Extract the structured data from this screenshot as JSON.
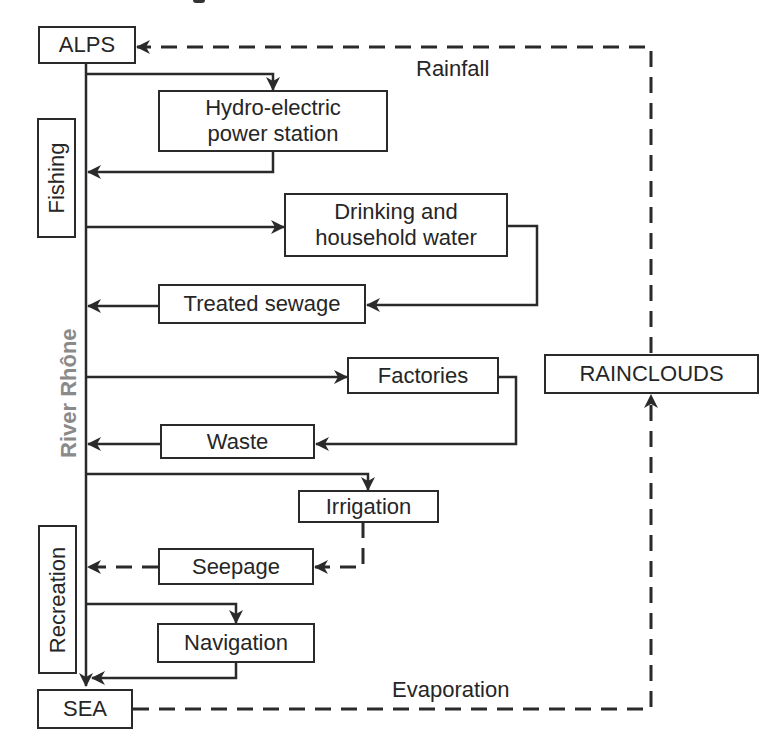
{
  "diagram": {
    "type": "flow",
    "river_label": "River Rhône",
    "nodes": {
      "alps": "ALPS",
      "hydro_line1": "Hydro-electric",
      "hydro_line2": "power station",
      "fishing": "Fishing",
      "drinking_line1": "Drinking and",
      "drinking_line2": "household water",
      "treated_sewage": "Treated sewage",
      "factories": "Factories",
      "waste": "Waste",
      "irrigation": "Irrigation",
      "seepage": "Seepage",
      "navigation": "Navigation",
      "recreation": "Recreation",
      "sea": "SEA",
      "rainclouds": "RAINCLOUDS"
    },
    "edge_labels": {
      "rainfall": "Rainfall",
      "evaporation": "Evaporation"
    },
    "edges": [
      {
        "from": "ALPS",
        "to": "River Rhône",
        "style": "solid"
      },
      {
        "from": "River Rhône",
        "to": "Hydro-electric power station",
        "style": "solid"
      },
      {
        "from": "Hydro-electric power station",
        "to": "River Rhône",
        "style": "solid"
      },
      {
        "from": "River Rhône",
        "to": "Drinking and household water",
        "style": "solid"
      },
      {
        "from": "Drinking and household water",
        "to": "Treated sewage",
        "style": "solid"
      },
      {
        "from": "Treated sewage",
        "to": "River Rhône",
        "style": "solid"
      },
      {
        "from": "River Rhône",
        "to": "Factories",
        "style": "solid"
      },
      {
        "from": "Factories",
        "to": "Waste",
        "style": "solid"
      },
      {
        "from": "Waste",
        "to": "River Rhône",
        "style": "solid"
      },
      {
        "from": "River Rhône",
        "to": "Irrigation",
        "style": "solid"
      },
      {
        "from": "Irrigation",
        "to": "Seepage",
        "style": "dashed"
      },
      {
        "from": "Seepage",
        "to": "River Rhône",
        "style": "dashed"
      },
      {
        "from": "River Rhône",
        "to": "Navigation",
        "style": "solid"
      },
      {
        "from": "Navigation",
        "to": "SEA",
        "style": "solid"
      },
      {
        "from": "River Rhône",
        "to": "SEA",
        "style": "solid"
      },
      {
        "from": "SEA",
        "to": "RAINCLOUDS",
        "style": "dashed",
        "label": "Evaporation"
      },
      {
        "from": "RAINCLOUDS",
        "to": "ALPS",
        "style": "dashed",
        "label": "Rainfall"
      }
    ],
    "colors": {
      "line": "#2a2a2a",
      "river_label": "#8a8a8a",
      "background": "#ffffff"
    }
  }
}
